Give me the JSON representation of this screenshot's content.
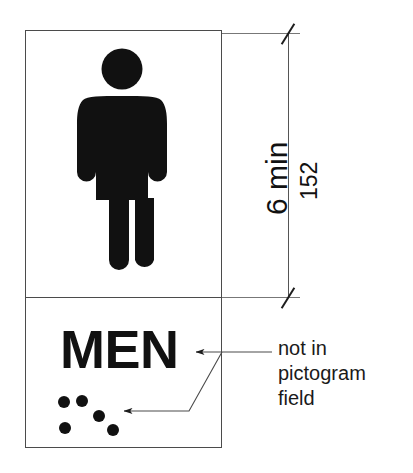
{
  "diagram": {
    "stroke_color": "#4b4b4b",
    "ink_color": "#111111",
    "leader_color": "#555555",
    "background": "#ffffff"
  },
  "sign": {
    "pictogram_icon": "standing-man-pictogram",
    "text_label": "MEN",
    "braille_icon": "braille-dots",
    "braille_dot_count": 5
  },
  "dimension": {
    "major_label": "6 min",
    "minor_label": "152",
    "tick_style": "architectural-slash",
    "orientation": "vertical",
    "measures": "pictogram field height"
  },
  "annotation": {
    "lines": [
      "not in",
      "pictogram",
      "field"
    ],
    "line1": "not in",
    "line2": "pictogram",
    "line3": "field",
    "points_to": [
      "text-label-men",
      "braille-dots"
    ]
  }
}
